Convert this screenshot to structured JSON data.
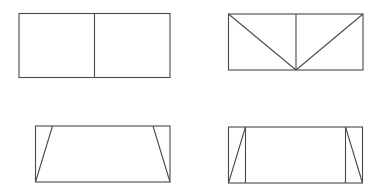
{
  "diagram": {
    "stroke_color": "#4a4a4a",
    "background": "#ffffff",
    "figures": [
      {
        "id": "fig-top-left",
        "name": "rectangle-split-two-squares",
        "outer": {
          "x": 19,
          "y": 13.5,
          "w": 151,
          "h": 64
        },
        "segments": [
          [
            94.5,
            13.5,
            94.5,
            77.5
          ]
        ]
      },
      {
        "id": "fig-top-right",
        "name": "rectangle-split-with-diagonals",
        "outer": {
          "x": 228.5,
          "y": 14,
          "w": 134.5,
          "h": 56
        },
        "segments": [
          [
            296,
            14,
            296,
            70
          ],
          [
            228.5,
            14,
            296,
            70
          ],
          [
            363,
            14,
            296,
            70
          ]
        ]
      },
      {
        "id": "fig-bottom-left",
        "name": "rectangle-with-trapezoid",
        "outer": {
          "x": 35.5,
          "y": 126,
          "w": 134.5,
          "h": 56
        },
        "segments": [
          [
            35.5,
            182,
            52.5,
            126
          ],
          [
            170,
            182,
            153,
            126
          ]
        ]
      },
      {
        "id": "fig-bottom-right",
        "name": "rectangle-with-side-triangles",
        "outer": {
          "x": 228.5,
          "y": 127,
          "w": 134,
          "h": 56
        },
        "segments": [
          [
            245.5,
            127,
            245.5,
            183
          ],
          [
            228.5,
            183,
            245.5,
            127
          ],
          [
            345.5,
            127,
            345.5,
            183
          ],
          [
            345.5,
            127,
            362.5,
            183
          ]
        ]
      }
    ]
  }
}
